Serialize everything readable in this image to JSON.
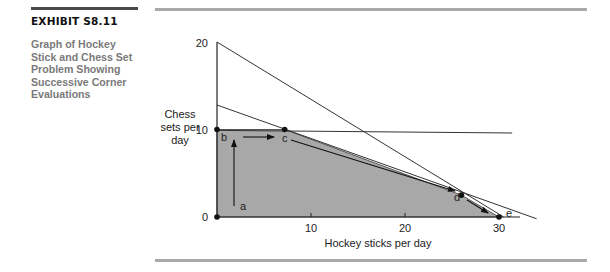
{
  "exhibit": {
    "label": "EXHIBIT S8.11",
    "caption_lines": [
      "Graph of Hockey",
      "Stick and Chess Set",
      "Problem Showing",
      "Successive Corner",
      "Evaluations"
    ]
  },
  "chart_data": {
    "type": "line",
    "title": "Graph of Hockey Stick and Chess Set Problem Showing Successive Corner Evaluations",
    "xlabel": "Hockey sticks per day",
    "ylabel_lines": [
      "Chess",
      "sets per",
      "day"
    ],
    "xlim": [
      0,
      35
    ],
    "ylim": [
      0,
      20
    ],
    "x_ticks": [
      0,
      10,
      20,
      30
    ],
    "x_tick_labels": [
      "10",
      "20",
      "30"
    ],
    "y_ticks": [
      0,
      10,
      20
    ],
    "y_tick_labels": [
      "0",
      "10",
      "20"
    ],
    "grid": false,
    "feasible_region": {
      "fill": "#a8a8a8",
      "vertices": [
        [
          0,
          0
        ],
        [
          0,
          10
        ],
        [
          7.2,
          10
        ],
        [
          26,
          2.5
        ],
        [
          30,
          0
        ]
      ]
    },
    "constraint_lines": [
      {
        "name": "constraint-1",
        "from": [
          0,
          20
        ],
        "to": [
          30.5,
          0
        ]
      },
      {
        "name": "constraint-2",
        "from": [
          0,
          12.8
        ],
        "to": [
          34,
          -0.2
        ]
      },
      {
        "name": "constraint-3",
        "from": [
          0,
          9.9
        ],
        "to": [
          31.4,
          9.6
        ]
      }
    ],
    "corner_points": [
      {
        "label": "a",
        "x": 0,
        "y": 0
      },
      {
        "label": "b",
        "x": 0,
        "y": 10
      },
      {
        "label": "c",
        "x": 7.2,
        "y": 10
      },
      {
        "label": "d",
        "x": 26,
        "y": 2.5
      },
      {
        "label": "e",
        "x": 30,
        "y": 0
      }
    ],
    "evaluation_path": [
      "a",
      "b",
      "c",
      "d",
      "e"
    ],
    "colors": {
      "region": "#a8a8a8",
      "line": "#333333",
      "point": "#111111",
      "rule": "#a9a9a9"
    }
  }
}
